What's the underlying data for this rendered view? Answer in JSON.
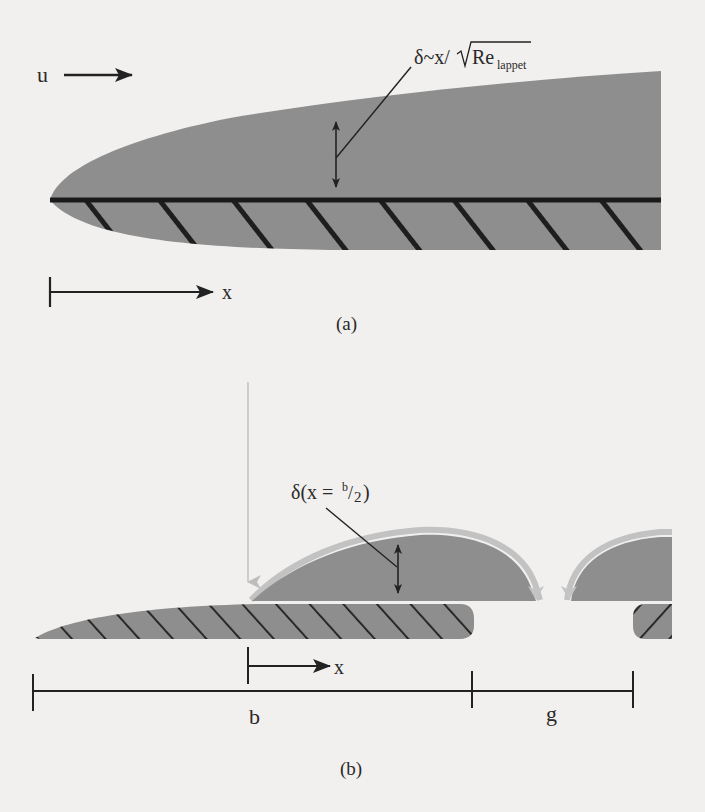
{
  "figure": {
    "background": "#f1f0ee",
    "body_gray": "#8e8e8e",
    "flow_gray": "#8c8c8c",
    "halo_gray": "#c2c2c2",
    "ink": "#222222"
  },
  "panel_a": {
    "flow_label": "u",
    "thickness_label": {
      "prefix": "δ~x/",
      "radicand": "Re",
      "subscript": "lappet"
    },
    "axis_label": "x",
    "caption": "(a)"
  },
  "panel_b": {
    "thickness_label": {
      "prefix": "δ(x = ",
      "num": "b",
      "slash": "/",
      "den": "2",
      "suffix": ")"
    },
    "axis_label": "x",
    "span_b_label": "b",
    "span_g_label": "g",
    "caption": "(b)"
  }
}
